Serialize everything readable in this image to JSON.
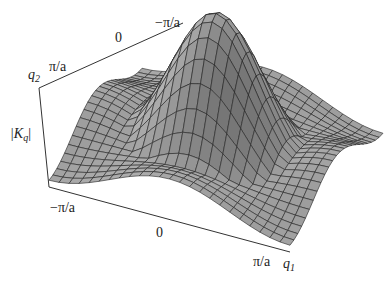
{
  "chart_data": {
    "type": "surface3d",
    "title": "",
    "zlabel": "|K_q|",
    "xlabel": "q_1",
    "ylabel": "q_2",
    "x_ticks": [
      "-π/a",
      "0",
      "π/a"
    ],
    "y_ticks": [
      "π/a",
      "0",
      "-π/a"
    ],
    "x_range": [
      -3.1416,
      3.1416
    ],
    "y_range": [
      -3.1416,
      3.1416
    ],
    "peak": {
      "q1": 0,
      "q2": 0,
      "relative_height": 1.0
    },
    "edge_height": 0.25,
    "grid": "mesh ~24x24 lines, gray shaded",
    "surface_color": "#a0a0a0",
    "line_color": "#222222"
  },
  "labels": {
    "zaxis": "|K",
    "zaxis_sub": "q",
    "zaxis_end": "|",
    "q2": "q",
    "q2_sub": "2",
    "q1": "q",
    "q1_sub": "1",
    "y_tick_pi": "π/a",
    "y_tick_0": "0",
    "y_tick_mpi": "−π/a",
    "x_tick_mpi": "−π/a",
    "x_tick_0": "0",
    "x_tick_pi": "π/a"
  }
}
